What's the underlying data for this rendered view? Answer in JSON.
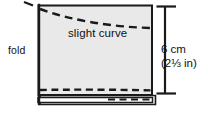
{
  "figure": {
    "labels": {
      "curve": "slight curve",
      "fold": "fold"
    },
    "dimension": {
      "metric": "6 cm",
      "imperial": "(2⅓ in)"
    },
    "colors": {
      "background": "#ffffff",
      "fabric_fill": "#e9e9e9",
      "fabric_fill_lower": "#f2f2f2",
      "outline": "#1a1a1a",
      "dash": "#1a1a1a",
      "text": "#111111"
    },
    "parts": {
      "panel_name": "fabric-panel",
      "curve_name": "slight-curve-dashed-line",
      "stitch_name": "stitch-dashed-line",
      "flap_name": "folded-flap",
      "fold_edge_name": "fold-edge"
    }
  }
}
